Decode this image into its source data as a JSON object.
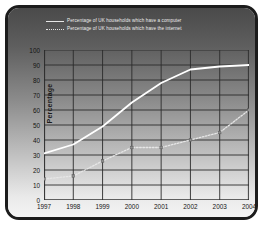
{
  "chart_data": {
    "type": "line",
    "title": "",
    "xlabel": "Year",
    "ylabel": "Percentage",
    "x": [
      1997,
      1998,
      1999,
      2000,
      2001,
      2002,
      2003,
      2004
    ],
    "xticklabels": [
      "1997",
      "1998",
      "1999",
      "2000",
      "2001",
      "2002",
      "2003",
      "2004"
    ],
    "yticklabels": [
      "0",
      "10",
      "20",
      "30",
      "40",
      "50",
      "60",
      "70",
      "80",
      "90",
      "100"
    ],
    "ylim": [
      0,
      100
    ],
    "xlim": [
      1997,
      2004
    ],
    "ytick_step": 10,
    "grid": true,
    "legend_position": "top",
    "series": [
      {
        "name": "Percentage of UK households which have a computer",
        "style": "solid",
        "color": "#ffffff",
        "values": [
          31,
          37,
          49,
          65,
          78,
          87,
          89,
          90
        ]
      },
      {
        "name": "Percentage of UK households which have the internet",
        "style": "dotted",
        "color": "#e6e6e6",
        "values": [
          14,
          16,
          26,
          35,
          35,
          40,
          45,
          60
        ]
      }
    ]
  },
  "legend": {
    "entries": [
      {
        "label": "Percentage of UK households which have a computer",
        "marker": "solid-line-swatch"
      },
      {
        "label": "Percentage of UK households which have the internet",
        "marker": "dotted-line-swatch"
      }
    ]
  },
  "axes": {
    "y_title": "Percentage",
    "x_title": "Year",
    "y_ticks": [
      "100",
      "90",
      "80",
      "70",
      "60",
      "50",
      "40",
      "30",
      "20",
      "10",
      "0"
    ],
    "x_ticks": [
      "1997",
      "1998",
      "1999",
      "2000",
      "2001",
      "2002",
      "2003",
      "2004"
    ]
  },
  "colors": {
    "frame": "#1c1c1c",
    "panel_top": "#4a4a4a",
    "panel_bottom": "#f4f4f4",
    "grid": "#2b2b2b",
    "computer_line": "#ffffff",
    "internet_line": "#e6e6e6",
    "text_dark": "#141414",
    "text_light": "#ededed"
  }
}
